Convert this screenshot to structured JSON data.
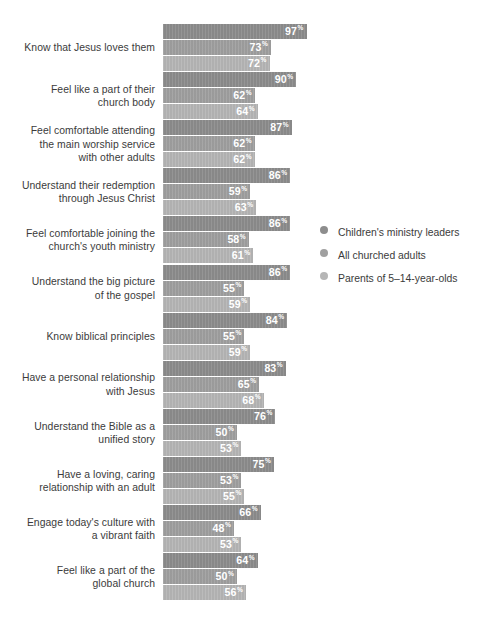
{
  "chart_data": {
    "type": "bar",
    "orientation": "horizontal",
    "title": "",
    "subtitle": "",
    "xlabel": "",
    "ylabel": "",
    "xlim": [
      0,
      100
    ],
    "grid": false,
    "value_suffix": "%",
    "legend_position": "right",
    "categories": [
      "Know that Jesus loves them",
      "Feel like a part of their\nchurch body",
      "Feel comfortable attending\nthe main worship service\nwith other adults",
      "Understand their redemption\nthrough Jesus Christ",
      "Feel comfortable joining the\nchurch's youth ministry",
      "Understand the big picture\nof the gospel",
      "Know biblical principles",
      "Have a personal relationship\nwith Jesus",
      "Understand the Bible as a\nunified story",
      "Have a loving, caring\nrelationship with an adult",
      "Engage today's culture with\na vibrant faith",
      "Feel like a part of the\nglobal church"
    ],
    "series": [
      {
        "name": "Children's ministry leaders",
        "color": "#8d8d8d",
        "values": [
          97,
          90,
          87,
          86,
          86,
          86,
          84,
          83,
          76,
          75,
          66,
          64
        ]
      },
      {
        "name": "All churched adults",
        "color": "#a0a0a0",
        "values": [
          73,
          62,
          62,
          59,
          58,
          55,
          55,
          65,
          50,
          53,
          48,
          50
        ]
      },
      {
        "name": "Parents of 5–14-year-olds",
        "color": "#b6b6b6",
        "values": [
          72,
          64,
          62,
          63,
          61,
          59,
          59,
          68,
          53,
          55,
          53,
          56
        ]
      }
    ]
  },
  "legend": {
    "items": [
      {
        "label": "Children's ministry leaders",
        "color": "#8d8d8d"
      },
      {
        "label": "All churched adults",
        "color": "#a0a0a0"
      },
      {
        "label": "Parents of 5–14-year-olds",
        "color": "#b6b6b6"
      }
    ]
  }
}
